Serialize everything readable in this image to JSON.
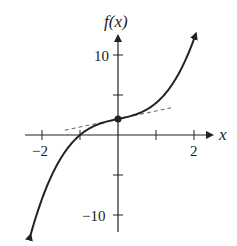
{
  "chart_data": {
    "type": "line",
    "title": "",
    "xlabel": "x",
    "ylabel": "f(x)",
    "xlim": [
      -2.3,
      2.3
    ],
    "ylim": [
      -12.5,
      12.5
    ],
    "x_ticks": [
      -2,
      -1,
      1,
      2
    ],
    "x_tick_labels": [
      "−2",
      "2"
    ],
    "y_ticks": [
      -10,
      -5,
      5,
      10
    ],
    "y_tick_labels": [
      "−10",
      "10"
    ],
    "grid": false,
    "series": [
      {
        "name": "f(x)",
        "function": "x^3 + x + 2",
        "style": "solid",
        "x": [
          -2.3,
          -2,
          -1.5,
          -1,
          -0.5,
          0,
          0.5,
          1,
          1.5,
          2,
          2.05
        ],
        "y": [
          -12.47,
          -8,
          -2.88,
          0,
          1.38,
          2,
          2.63,
          4,
          6.88,
          12,
          12.66
        ]
      },
      {
        "name": "tangent at x=0",
        "function": "x + 2",
        "style": "dashed",
        "x": [
          -1.4,
          1.4
        ],
        "y": [
          0.6,
          3.4
        ]
      }
    ],
    "points": [
      {
        "x": 0,
        "y": 2,
        "label": ""
      }
    ]
  }
}
